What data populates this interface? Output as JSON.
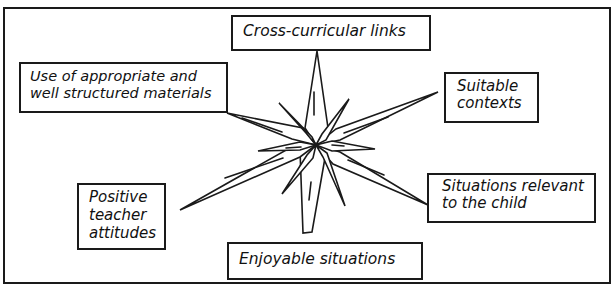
{
  "diagram": {
    "center": "star",
    "nodes": [
      {
        "id": "top",
        "lines": [
          "Cross-curricular links"
        ]
      },
      {
        "id": "upper_left",
        "lines": [
          "Use of appropriate and",
          "well structured materials"
        ]
      },
      {
        "id": "upper_right",
        "lines": [
          "Suitable",
          "contexts"
        ]
      },
      {
        "id": "lower_left",
        "lines": [
          "Positive",
          "teacher",
          "attitudes"
        ]
      },
      {
        "id": "lower_right",
        "lines": [
          "Situations relevant",
          "to the child"
        ]
      },
      {
        "id": "bottom",
        "lines": [
          "Enjoyable situations"
        ]
      }
    ]
  }
}
